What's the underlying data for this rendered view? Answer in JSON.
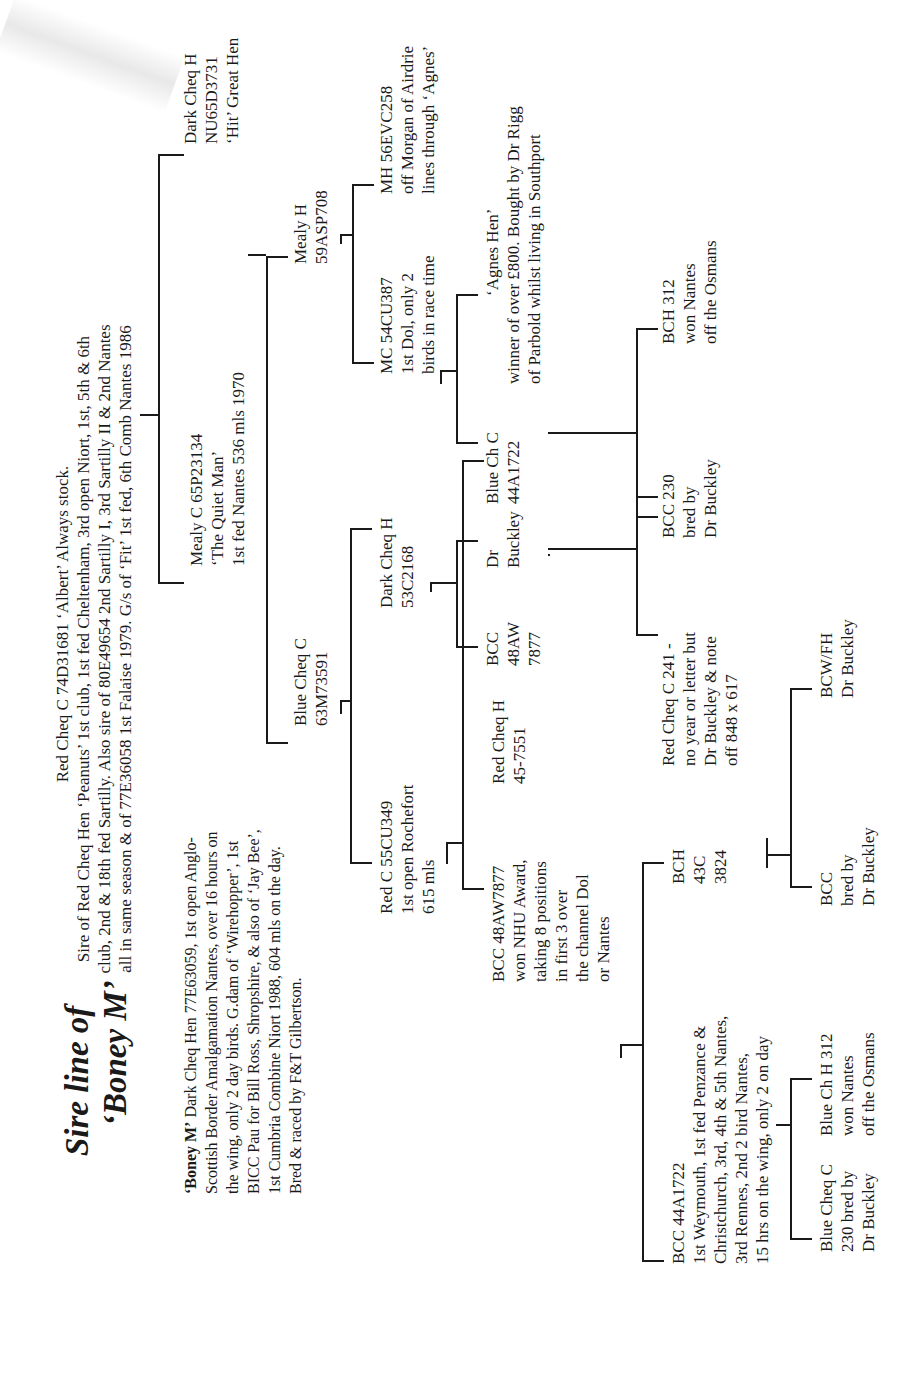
{
  "title": {
    "line1": "Sire line of",
    "line2": "‘Boney M’"
  },
  "intro": {
    "bold_name": "‘Boney M’",
    "lines": [
      " Dark Cheq Hen 77E63059, 1st open Anglo-",
      "Scottish Border Amalgamation Nantes, over 16 hours on",
      "the wing, only 2 day birds. G.dam of ‘Wirehopper’, 1st",
      "BICC Pau for Bill Ross, Shropshire, & also of ‘Jay Bee’,",
      "1st Cumbria Combine Niort 1988, 604 mls on the day.",
      "Bred & raced by F&T Gilbertson."
    ]
  },
  "birds": {
    "root": {
      "lines": [
        "Red Cheq C 74D31681  ‘Albert’  Always stock.",
        "Sire of Red Cheq Hen ‘Peanuts’ 1st club, 1st fed Cheltenham, 3rd open Niort, 1st, 5th & 6th",
        "club, 2nd & 18th fed Sartilly. Also sire of 80E49654 2nd Sartilly I, 3rd Sartilly II & 2nd Nantes",
        "all in same season & of 77E36058 1st Falaise 1979. G/s of ‘Fit’ 1st fed, 6th Comb Nantes 1986"
      ]
    },
    "dark_cheq_h_hit": {
      "lines": [
        "Dark Cheq H",
        "NU65D3731",
        "‘Hit’  Great Hen"
      ]
    },
    "mealy_c_quiet_man": {
      "lines": [
        "Mealy C 65P23134",
        "‘The Quiet Man’",
        "1st fed Nantes 536 mls 1970"
      ]
    },
    "mealy_h": {
      "lines": [
        "Mealy H",
        "59ASP708"
      ]
    },
    "blue_cheq_c_63m": {
      "lines": [
        "Blue Cheq C",
        "63M73591"
      ]
    },
    "mh_56evc258": {
      "lines": [
        "MH 56EVC258",
        "off Morgan of Airdrie",
        "lines through ‘Agnes’"
      ]
    },
    "mc_54cu387": {
      "lines": [
        "MC 54CU387",
        "1st Dol, only 2",
        "birds in race time"
      ]
    },
    "dark_cheq_h_53c": {
      "lines": [
        "Dark Cheq H",
        "53C2168"
      ]
    },
    "red_c_55cu349": {
      "lines": [
        "Red C 55CU349",
        "1st open Rochefort",
        "615 mls"
      ]
    },
    "agnes_hen": {
      "lines": [
        "‘Agnes Hen’",
        "winner of over £800. Bought by Dr Rigg",
        "of Parbold whilst living in Southport"
      ]
    },
    "blue_ch_c_44a": {
      "lines": [
        "Blue Ch C",
        "44A1722"
      ]
    },
    "dr_buckley_1": {
      "lines": [
        "Dr",
        "Buckley"
      ]
    },
    "bcc_48aw_short": {
      "lines": [
        "BCC",
        "48AW",
        "7877"
      ]
    },
    "red_cheq_h_45": {
      "lines": [
        "Red Cheq H",
        "45-7551"
      ]
    },
    "bcc_48aw7877": {
      "lines": [
        "BCC 48AW7877",
        "won NHU Award,",
        "taking 8 positions",
        "in first 3 over",
        "the channel Dol",
        "or Nantes"
      ]
    },
    "bch_312": {
      "lines": [
        "BCH 312",
        "won Nantes",
        "off the Osmans"
      ]
    },
    "bcc_230": {
      "lines": [
        "BCC 230",
        "bred by",
        "Dr Buckley"
      ]
    },
    "red_cheq_c_241": {
      "lines": [
        "Red Cheq C 241 -",
        "no year or letter but",
        "Dr Buckley & note",
        "off 848 x 617"
      ]
    },
    "bch_43c": {
      "lines": [
        "BCH",
        "43C",
        "3824"
      ]
    },
    "bcc_44a1722": {
      "lines": [
        "BCC 44A1722",
        "1st Weymouth, 1st fed Penzance &",
        "Christchurch, 3rd, 4th & 5th Nantes,",
        "3rd Rennes, 2nd 2 bird Nantes,",
        "15 hrs on the wing, only 2 on day"
      ]
    },
    "bcw_fh": {
      "lines": [
        "BCW/FH",
        "Dr Buckley"
      ]
    },
    "bcc_bred": {
      "lines": [
        "BCC",
        "bred by",
        "Dr Buckley"
      ]
    },
    "blue_ch_h_312": {
      "lines": [
        "Blue Ch H 312",
        "won Nantes",
        "off the Osmans"
      ]
    },
    "blue_cheq_c_230": {
      "lines": [
        "Blue Cheq C",
        "230  bred by",
        "Dr Buckley"
      ]
    }
  }
}
